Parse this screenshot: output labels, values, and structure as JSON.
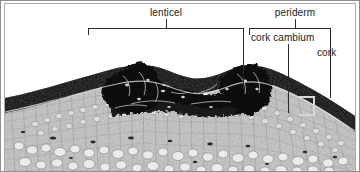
{
  "figure": {
    "background_color": "#ffffff",
    "frame_color": "#8d8f91",
    "line_color": "#2b2b2b",
    "marker_color": "#d8d8d8"
  },
  "labels": {
    "lenticel": "lenticel",
    "periderm": "periderm",
    "cork_cambium": "cork cambium",
    "cork": "cork"
  },
  "annotations": [
    {
      "label": "lenticel",
      "type": "span-bracket",
      "describes": "raised, erupted mass of loose suberized cells breaking through the bark surface"
    },
    {
      "label": "periderm",
      "type": "span-bracket",
      "children": [
        "cork cambium",
        "cork"
      ],
      "describes": "outer protective tissue layer comprising cork cambium and cork"
    },
    {
      "label": "cork cambium",
      "type": "leader-line",
      "describes": "meristematic cell layer producing cork outward"
    },
    {
      "label": "cork",
      "type": "leader-line",
      "describes": "dark suberized outer cork layer, thickness marked by bracket"
    }
  ]
}
